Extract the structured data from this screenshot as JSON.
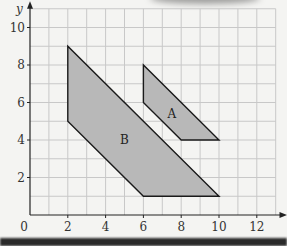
{
  "chart_data": {
    "type": "area",
    "title": "",
    "xlabel": "x",
    "ylabel": "y",
    "xlim": [
      0,
      13
    ],
    "ylim": [
      0,
      11
    ],
    "grid": true,
    "x_ticks": [
      0,
      2,
      4,
      6,
      8,
      10,
      12
    ],
    "y_ticks": [
      2,
      4,
      6,
      8,
      10
    ],
    "shapes": [
      {
        "name": "A",
        "label_pos": [
          7.5,
          5.4
        ],
        "vertices": [
          [
            6,
            8
          ],
          [
            6,
            6
          ],
          [
            8,
            4
          ],
          [
            10,
            4
          ]
        ]
      },
      {
        "name": "B",
        "label_pos": [
          5,
          4
        ],
        "vertices": [
          [
            2,
            9
          ],
          [
            2,
            5
          ],
          [
            6,
            1
          ],
          [
            10,
            1
          ]
        ]
      }
    ],
    "fill_color": "#b8b8b8",
    "stroke_color": "#1a1a1a",
    "grid_color": "#c8c8c8"
  }
}
